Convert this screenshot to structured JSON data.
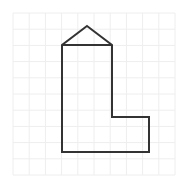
{
  "canvas": {
    "width": 187,
    "height": 192,
    "background_color": "#ffffff"
  },
  "grid": {
    "visible": true,
    "line_color": "#eeeeee",
    "line_width": 1,
    "cell_size": 16.2,
    "origin_x": 13,
    "origin_y": 13,
    "columns": 10,
    "rows": 10,
    "x_lines": [
      13,
      29.2,
      45.4,
      61.6,
      77.8,
      94,
      110.2,
      126.4,
      142.6,
      158.8,
      175
    ],
    "y_lines": [
      13,
      29.2,
      45.4,
      61.6,
      77.8,
      94,
      110.2,
      126.4,
      142.6,
      158.8,
      175
    ]
  },
  "shape": {
    "name": "l-shaped-polygon-with-roof",
    "description": "Closed outlined polygon resembling a tower with a triangular roof and an L-shaped base",
    "stroke_color": "#333333",
    "stroke_width": 2,
    "fill": "none",
    "vertex_count": 8,
    "points": [
      {
        "label": "roof-apex",
        "x": 87,
        "y": 26
      },
      {
        "label": "roof-right-eave",
        "x": 112,
        "y": 45
      },
      {
        "label": "upper-right-corner",
        "x": 112,
        "y": 117
      },
      {
        "label": "notch-inner-corner",
        "x": 149,
        "y": 117
      },
      {
        "label": "lower-right-corner",
        "x": 149,
        "y": 152
      },
      {
        "label": "bottom-left-corner",
        "x": 62,
        "y": 152
      },
      {
        "label": "upper-left-corner",
        "x": 62,
        "y": 45
      },
      {
        "label": "roof-left-eave",
        "x": 62,
        "y": 45
      }
    ],
    "path_d": "M 87 26 L 112 45 L 112 117 L 149 117 L 149 152 L 62 152 L 62 45 Z",
    "eave_line_d": "M 62 45 L 112 45"
  },
  "labels": {
    "title": "",
    "annotations": []
  }
}
